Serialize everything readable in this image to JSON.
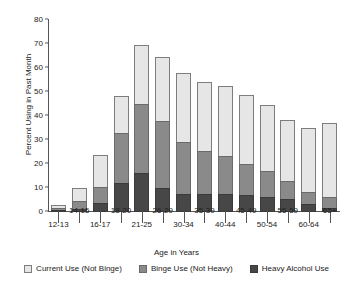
{
  "chart_data": {
    "type": "bar",
    "stacked": true,
    "title": "",
    "xlabel": "Age in Years",
    "ylabel": "Percent Using in Past Month",
    "ylim": [
      0,
      80
    ],
    "yticks": [
      0,
      10,
      20,
      30,
      40,
      50,
      60,
      70,
      80
    ],
    "grid": false,
    "legend_position": "bottom",
    "categories": [
      "12-13",
      "14-15",
      "16-17",
      "18-20",
      "21-25",
      "26-29",
      "30-34",
      "35-39",
      "40-44",
      "45-49",
      "50-54",
      "55-59",
      "60-64",
      "65+"
    ],
    "series": [
      {
        "name": "Heavy Alcohol Use",
        "color": "#474747",
        "values": [
          0.3,
          1.3,
          3.6,
          11.9,
          16.3,
          10.1,
          7.5,
          7.3,
          7.3,
          7.0,
          6.3,
          5.5,
          3.4,
          1.6
        ]
      },
      {
        "name": "Binge Use (Not Heavy)",
        "color": "#8a8a8a",
        "values": [
          1.1,
          3.9,
          7.1,
          21.3,
          29.2,
          28.3,
          21.9,
          18.7,
          16.5,
          13.5,
          11.1,
          8.0,
          5.2,
          4.9
        ]
      },
      {
        "name": "Current Use (Not Binge)",
        "color": "#e6e6e6",
        "values": [
          2.0,
          5.5,
          14.1,
          15.8,
          25.0,
          27.0,
          29.2,
          29.0,
          29.5,
          29.0,
          28.0,
          25.5,
          27.4,
          31.5
        ]
      }
    ],
    "totals": [
      3.4,
      10.7,
      24.8,
      49.0,
      70.5,
      65.4,
      58.6,
      55.0,
      53.3,
      49.5,
      45.4,
      39.0,
      36.0,
      38.0
    ]
  },
  "legend": {
    "items": [
      {
        "label": "Current Use (Not Binge)",
        "key": "c0"
      },
      {
        "label": "Binge Use (Not Heavy)",
        "key": "c1"
      },
      {
        "label": "Heavy Alcohol Use",
        "key": "c2"
      }
    ]
  }
}
